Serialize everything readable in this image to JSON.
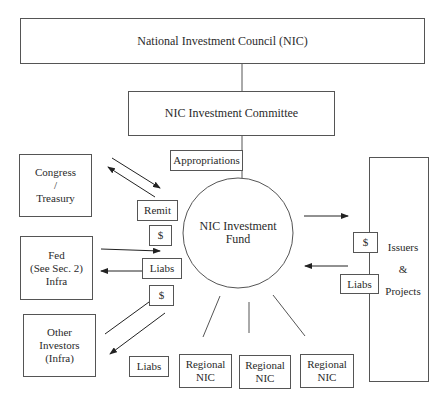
{
  "council": {
    "label": "National Investment Council (NIC)"
  },
  "committee": {
    "label": "NIC Investment Committee"
  },
  "appropriations": {
    "label": "Appropriations"
  },
  "fund": {
    "line1": "NIC Investment",
    "line2": "Fund"
  },
  "congress": {
    "line1": "Congress",
    "line2": "/",
    "line3": "Treasury"
  },
  "fed": {
    "line1": "Fed",
    "line2": "(See Sec. 2)",
    "line3": "Infra"
  },
  "other_investors": {
    "line1": "Other",
    "line2": "Investors",
    "line3": "(Infra)"
  },
  "remit": {
    "label": "Remit"
  },
  "dollar_fed": {
    "label": "$"
  },
  "liabs_fed": {
    "label": "Liabs"
  },
  "dollar_other": {
    "label": "$"
  },
  "liabs_other": {
    "label": "Liabs"
  },
  "regional": [
    {
      "line1": "Regional",
      "line2": "NIC"
    },
    {
      "line1": "Regional",
      "line2": "NIC"
    },
    {
      "line1": "Regional",
      "line2": "NIC"
    }
  ],
  "issuers": {
    "line1": "Issuers",
    "line2": "&",
    "line3": "Projects"
  },
  "dollar_issuers": {
    "label": "$"
  },
  "liabs_issuers": {
    "label": "Liabs"
  }
}
